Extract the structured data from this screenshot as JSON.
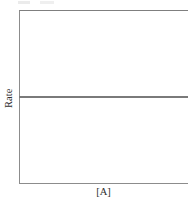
{
  "figure": {
    "background_color": "#ffffff",
    "frame_color": "#8c8c8c",
    "line_color": "#7a7a7a",
    "text_color": "#2e2e2e"
  },
  "axes": {
    "ylabel": "Rate",
    "xlabel": "[A]"
  },
  "chart_data": {
    "type": "line",
    "title": "",
    "subtitle": "",
    "xlabel": "[A]",
    "ylabel": "Rate",
    "xlim": [
      0,
      1
    ],
    "ylim": [
      0,
      1
    ],
    "xticks": [],
    "yticks": [],
    "xticklabels": [],
    "yticklabels": [],
    "grid": false,
    "legend": false,
    "legend_position": "none",
    "annotations": [],
    "series": [
      {
        "name": "rate",
        "x": [
          0,
          0.25,
          0.5,
          0.75,
          1
        ],
        "values": [
          0.5,
          0.5,
          0.5,
          0.5,
          0.5
        ],
        "color": "#7a7a7a",
        "linewidth": 2,
        "description": "horizontal flat line spanning full plot width at mid height (zero-order: rate independent of [A])"
      }
    ]
  }
}
